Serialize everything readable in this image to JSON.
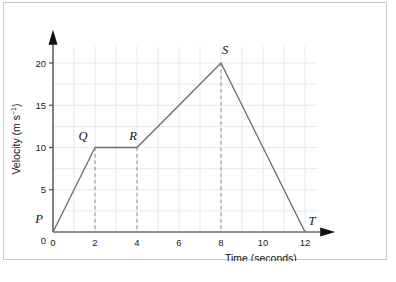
{
  "figure": {
    "background_color": "#ffffff",
    "border_color": "#c9c9c9"
  },
  "chart_data": {
    "type": "line",
    "title": "",
    "subtitle": "",
    "xlabel": "Time (seconds)",
    "ylabel": "Velocity (m s⁻¹)",
    "ylabel_base": "Velocity (m s",
    "ylabel_exponent": "−1",
    "ylabel_close": ")",
    "xlim": [
      0,
      13.2
    ],
    "ylim": [
      0,
      23
    ],
    "xticks": [
      "0",
      "2",
      "4",
      "6",
      "8",
      "10",
      "12"
    ],
    "xtick_values": [
      0,
      2,
      4,
      6,
      8,
      10,
      12
    ],
    "yticks": [
      "0",
      "5",
      "10",
      "15",
      "20"
    ],
    "ytick_values": [
      0,
      5,
      10,
      15,
      20
    ],
    "grid": true,
    "grid_color": "#e4eaf0",
    "grid_x_step": 1,
    "grid_y_step": 2.5,
    "legend": "none",
    "line_color": "#6b6b6b",
    "series": [
      {
        "name": "velocity",
        "x": [
          0,
          2,
          4,
          8,
          12
        ],
        "values": [
          0,
          10,
          10,
          20,
          0
        ]
      }
    ],
    "points": [
      {
        "label": "P",
        "x": 0,
        "y": 0,
        "label_dx": -14,
        "label_dy": -9
      },
      {
        "label": "Q",
        "x": 2,
        "y": 10,
        "label_dx": -12,
        "label_dy": -8
      },
      {
        "label": "R",
        "x": 4,
        "y": 10,
        "label_dx": -4,
        "label_dy": -8
      },
      {
        "label": "S",
        "x": 8,
        "y": 20,
        "label_dx": 4,
        "label_dy": -9
      },
      {
        "label": "T",
        "x": 12,
        "y": 0,
        "label_dx": 7,
        "label_dy": -7
      }
    ],
    "dropline_color": "#8c8c8c",
    "droplines": [
      {
        "x": 2,
        "y_top": 10
      },
      {
        "x": 4,
        "y_top": 10
      },
      {
        "x": 8,
        "y_top": 20
      }
    ],
    "axis_color": "#4d4d4d",
    "annotations": []
  }
}
